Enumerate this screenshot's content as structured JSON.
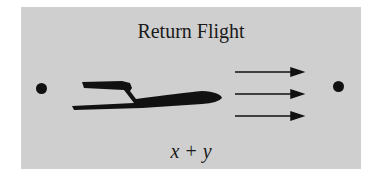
{
  "diagram": {
    "title": "Return Flight",
    "expression": "x + y",
    "elements": [
      "start-point",
      "airplane",
      "wind-arrows (3)",
      "end-point"
    ],
    "colors": {
      "background": "#cfcfcf",
      "ink": "#111111"
    }
  }
}
